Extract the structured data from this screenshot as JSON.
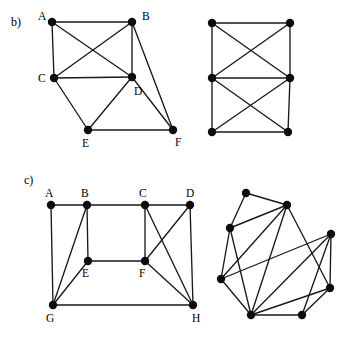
{
  "figure": {
    "background_color": "#ffffff",
    "ink_color": "#0d0d0d",
    "edge_color": "#1a1a1a",
    "width": 355,
    "height": 339,
    "node_radius": 4.2,
    "parts": [
      {
        "id": "b",
        "label": "b)",
        "label_pos": {
          "x": 11,
          "y": 26
        },
        "graphs": [
          {
            "id": "b-left",
            "name": "labeled-graph-b",
            "labeled": true,
            "nodes": [
              {
                "id": "A",
                "label": "A",
                "x": 52,
                "y": 22,
                "lx": 38,
                "ly": 20
              },
              {
                "id": "B",
                "label": "B",
                "x": 132,
                "y": 22,
                "lx": 142,
                "ly": 20
              },
              {
                "id": "C",
                "label": "C",
                "x": 54,
                "y": 78,
                "lx": 38,
                "ly": 82
              },
              {
                "id": "D",
                "label": "D",
                "x": 132,
                "y": 77,
                "lx": 134,
                "ly": 95
              },
              {
                "id": "E",
                "label": "E",
                "x": 88,
                "y": 130,
                "lx": 82,
                "ly": 147
              },
              {
                "id": "F",
                "label": "F",
                "x": 173,
                "y": 130,
                "lx": 175,
                "ly": 146
              }
            ],
            "edges": [
              [
                "A",
                "B"
              ],
              [
                "A",
                "C"
              ],
              [
                "A",
                "D"
              ],
              [
                "B",
                "C"
              ],
              [
                "B",
                "D"
              ],
              [
                "B",
                "F"
              ],
              [
                "C",
                "D"
              ],
              [
                "C",
                "E"
              ],
              [
                "D",
                "E"
              ],
              [
                "D",
                "F"
              ],
              [
                "E",
                "F"
              ]
            ]
          },
          {
            "id": "b-right",
            "name": "unlabeled-graph-b",
            "labeled": false,
            "nodes": [
              {
                "id": "p1",
                "label": "",
                "x": 212,
                "y": 23
              },
              {
                "id": "p2",
                "label": "",
                "x": 290,
                "y": 23
              },
              {
                "id": "p3",
                "label": "",
                "x": 212,
                "y": 78
              },
              {
                "id": "p4",
                "label": "",
                "x": 290,
                "y": 78
              },
              {
                "id": "p5",
                "label": "",
                "x": 212,
                "y": 132
              },
              {
                "id": "p6",
                "label": "",
                "x": 288,
                "y": 132
              }
            ],
            "edges": [
              [
                "p1",
                "p2"
              ],
              [
                "p1",
                "p3"
              ],
              [
                "p1",
                "p4"
              ],
              [
                "p2",
                "p3"
              ],
              [
                "p2",
                "p4"
              ],
              [
                "p3",
                "p4"
              ],
              [
                "p3",
                "p5"
              ],
              [
                "p3",
                "p6"
              ],
              [
                "p4",
                "p5"
              ],
              [
                "p4",
                "p6"
              ],
              [
                "p5",
                "p6"
              ]
            ]
          }
        ]
      },
      {
        "id": "c",
        "label": "c)",
        "label_pos": {
          "x": 24,
          "y": 184
        },
        "graphs": [
          {
            "id": "c-left",
            "name": "labeled-graph-c",
            "labeled": true,
            "nodes": [
              {
                "id": "A",
                "label": "A",
                "x": 51,
                "y": 205,
                "lx": 45,
                "ly": 197
              },
              {
                "id": "B",
                "label": "B",
                "x": 87,
                "y": 205,
                "lx": 81,
                "ly": 197
              },
              {
                "id": "C",
                "label": "C",
                "x": 145,
                "y": 205,
                "lx": 139,
                "ly": 197
              },
              {
                "id": "D",
                "label": "D",
                "x": 190,
                "y": 205,
                "lx": 186,
                "ly": 197
              },
              {
                "id": "E",
                "label": "E",
                "x": 88,
                "y": 261,
                "lx": 82,
                "ly": 277
              },
              {
                "id": "F",
                "label": "F",
                "x": 145,
                "y": 261,
                "lx": 139,
                "ly": 277
              },
              {
                "id": "G",
                "label": "G",
                "x": 53,
                "y": 305,
                "lx": 46,
                "ly": 322
              },
              {
                "id": "H",
                "label": "H",
                "x": 193,
                "y": 305,
                "lx": 192,
                "ly": 322
              }
            ],
            "edges": [
              [
                "A",
                "B"
              ],
              [
                "A",
                "G"
              ],
              [
                "B",
                "C"
              ],
              [
                "B",
                "E"
              ],
              [
                "B",
                "G"
              ],
              [
                "C",
                "D"
              ],
              [
                "C",
                "F"
              ],
              [
                "C",
                "H"
              ],
              [
                "D",
                "F"
              ],
              [
                "D",
                "H"
              ],
              [
                "E",
                "F"
              ],
              [
                "E",
                "G"
              ],
              [
                "F",
                "H"
              ],
              [
                "G",
                "H"
              ]
            ]
          },
          {
            "id": "c-right",
            "name": "unlabeled-graph-c",
            "labeled": false,
            "nodes": [
              {
                "id": "q1",
                "label": "",
                "x": 246,
                "y": 193
              },
              {
                "id": "q2",
                "label": "",
                "x": 287,
                "y": 205
              },
              {
                "id": "q3",
                "label": "",
                "x": 230,
                "y": 228
              },
              {
                "id": "q4",
                "label": "",
                "x": 331,
                "y": 234
              },
              {
                "id": "q5",
                "label": "",
                "x": 221,
                "y": 279
              },
              {
                "id": "q6",
                "label": "",
                "x": 330,
                "y": 288
              },
              {
                "id": "q7",
                "label": "",
                "x": 251,
                "y": 315
              },
              {
                "id": "q8",
                "label": "",
                "x": 302,
                "y": 315
              }
            ],
            "edges": [
              [
                "q1",
                "q2"
              ],
              [
                "q1",
                "q3"
              ],
              [
                "q2",
                "q3"
              ],
              [
                "q2",
                "q5"
              ],
              [
                "q2",
                "q6"
              ],
              [
                "q2",
                "q7"
              ],
              [
                "q3",
                "q5"
              ],
              [
                "q3",
                "q7"
              ],
              [
                "q4",
                "q5"
              ],
              [
                "q4",
                "q6"
              ],
              [
                "q4",
                "q7"
              ],
              [
                "q4",
                "q8"
              ],
              [
                "q5",
                "q7"
              ],
              [
                "q6",
                "q7"
              ],
              [
                "q6",
                "q8"
              ],
              [
                "q7",
                "q8"
              ]
            ]
          }
        ]
      }
    ]
  }
}
